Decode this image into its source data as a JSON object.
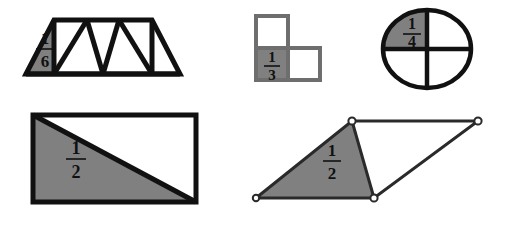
{
  "page": {
    "background_color": "#ffffff",
    "shade_color": "#808080",
    "outline_color": "#111111",
    "square_outline_color": "#6e6e6e"
  },
  "figures": [
    {
      "id": "trapezoid",
      "name": "trapezoid-divided-into-six-triangles",
      "shape": "trapezoid",
      "total_parts": 6,
      "shaded_parts": 1,
      "label": {
        "numerator": "1",
        "denominator": "6",
        "text": "1/6"
      },
      "shaded_position": "leftmost-triangle"
    },
    {
      "id": "squares",
      "name": "three-squares-zigzag",
      "shape": "squares",
      "total_parts": 3,
      "shaded_parts": 1,
      "label": {
        "numerator": "1",
        "denominator": "3",
        "text": "1/3"
      },
      "shaded_position": "bottom-left-square"
    },
    {
      "id": "circle",
      "name": "circle-divided-into-quarters",
      "shape": "circle",
      "total_parts": 4,
      "shaded_parts": 1,
      "label": {
        "numerator": "1",
        "denominator": "4",
        "text": "1/4"
      },
      "shaded_position": "upper-left-quadrant"
    },
    {
      "id": "rectangle",
      "name": "rectangle-split-by-diagonal",
      "shape": "rectangle",
      "total_parts": 2,
      "shaded_parts": 1,
      "label": {
        "numerator": "1",
        "denominator": "2",
        "text": "1/2"
      },
      "shaded_position": "lower-left-triangle"
    },
    {
      "id": "parallelogram",
      "name": "parallelogram-split-by-diagonal",
      "shape": "parallelogram",
      "total_parts": 2,
      "shaded_parts": 1,
      "label": {
        "numerator": "1",
        "denominator": "2",
        "text": "1/2"
      },
      "shaded_position": "left-triangle",
      "vertex_markers": 4
    }
  ]
}
